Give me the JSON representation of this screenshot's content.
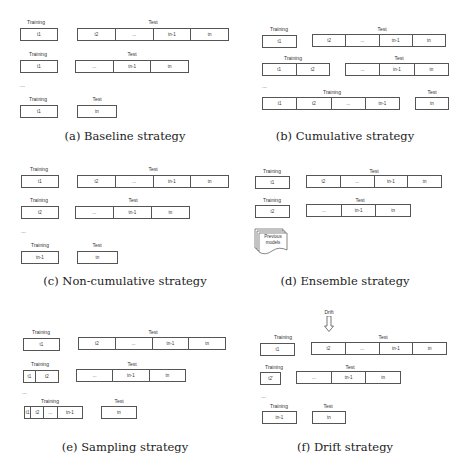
{
  "labels": {
    "training": "Training",
    "test": "Test",
    "ellipsis_row": "...",
    "drift": "Drift"
  },
  "captions": {
    "a": "(a) Baseline strategy",
    "b": "(b) Cumulative strategy",
    "c": "(c) Non-cumulative strategy",
    "d": "(d) Ensemble strategy",
    "e": "(e) Sampling strategy",
    "f": "(f) Drift strategy"
  },
  "cells": {
    "t1": "t1",
    "t2": "t2",
    "dots": "...",
    "tn1": "tn-1",
    "tn": "tn",
    "t2p": "t2'"
  },
  "previous_models": "Previous models"
}
